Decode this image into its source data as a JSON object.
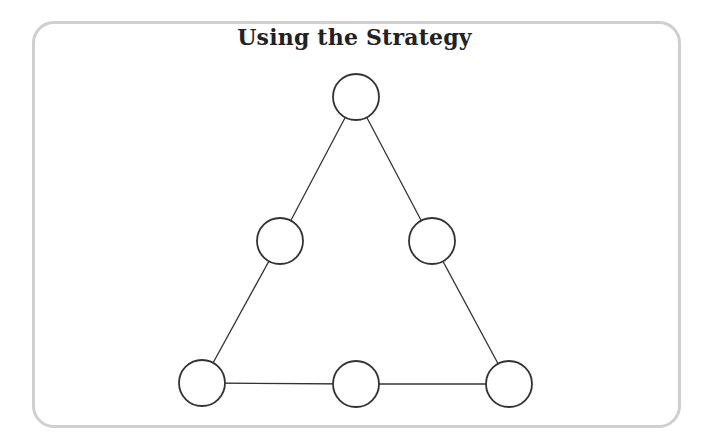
{
  "title": "Using the Strategy",
  "colors": {
    "frame_border": "#cfcfcf",
    "line": "#333333",
    "node_fill": "#ffffff"
  },
  "diagram": {
    "shape": "triangle",
    "node_radius": 23,
    "nodes": [
      {
        "id": "top",
        "x": 356,
        "y": 97,
        "label": ""
      },
      {
        "id": "left-middle",
        "x": 280,
        "y": 241,
        "label": ""
      },
      {
        "id": "right-middle",
        "x": 432,
        "y": 241,
        "label": ""
      },
      {
        "id": "bottom-left",
        "x": 202,
        "y": 383,
        "label": ""
      },
      {
        "id": "bottom-middle",
        "x": 356,
        "y": 384,
        "label": ""
      },
      {
        "id": "bottom-right",
        "x": 509,
        "y": 384,
        "label": ""
      }
    ],
    "edges": [
      [
        "top",
        "left-middle"
      ],
      [
        "left-middle",
        "bottom-left"
      ],
      [
        "top",
        "right-middle"
      ],
      [
        "right-middle",
        "bottom-right"
      ],
      [
        "bottom-left",
        "bottom-middle"
      ],
      [
        "bottom-middle",
        "bottom-right"
      ]
    ]
  }
}
